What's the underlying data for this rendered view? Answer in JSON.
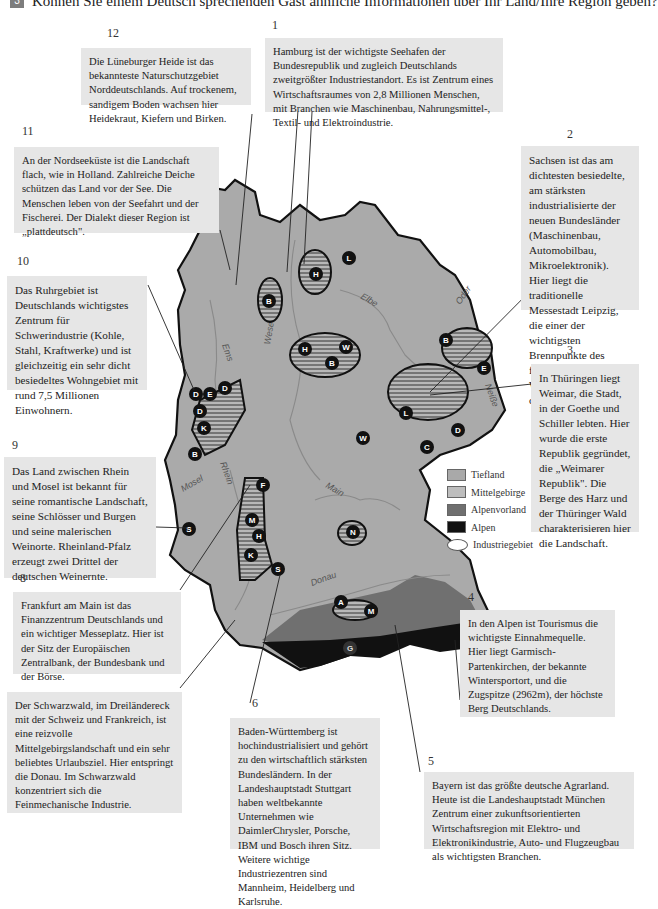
{
  "header": {
    "exercise_number": "3",
    "instruction": "Können Sie einem Deutsch sprechenden Gast ähnliche Informationen über Ihr Land/Ihre Region geben?"
  },
  "boxes": [
    {
      "number": "1",
      "text": "Hamburg ist der wichtigste Seehafen der Bundesrepublik und zugleich Deutschlands zweitgrößter Industriestandort. Es ist Zentrum eines Wirtschaftsraumes von 2,8 Millionen Menschen, mit Branchen wie Maschinenbau, Nahrungsmittel-, Textil- und Elektroindustrie."
    },
    {
      "number": "2",
      "text": "Sachsen ist das am dichtesten besiedelte, am stärksten industrialisierte der neuen Bundesländer (Maschinenbau, Automobilbau, Mikroelektronik). Hier liegt die traditionelle Messestadt Leipzig, die einer der wichtigsten Brennpunkte des friedlichen Widerstandes gegen das DDR-Regime war."
    },
    {
      "number": "3",
      "text": "In Thüringen liegt Weimar, die Stadt, in der Goethe und Schiller lebten. Hier wurde die erste Republik gegründet, die „Weimarer Republik\". Die Berge des Harz und der Thüringer Wald charakterisieren hier die Landschaft."
    },
    {
      "number": "4",
      "text": "In den Alpen ist Tourismus die wichtigste Einnahmequelle. Hier liegt Garmisch-Partenkirchen, der bekannte Wintersportort, und die Zugspitze (2962m), der höchste Berg Deutschlands."
    },
    {
      "number": "5",
      "text": "Bayern ist das größte deutsche Agrarland. Heute ist die Landeshauptstadt München Zentrum einer zukunftsorientierten Wirtschaftsregion mit Elektro- und Elektronikindustrie, Auto- und Flugzeugbau als wichtigsten Branchen."
    },
    {
      "number": "6",
      "text": "Baden-Württemberg ist hochindustrialisiert und gehört zu den wirtschaftlich stärksten Bundesländern. In der Landeshauptstadt Stuttgart haben weltbekannte Unternehmen wie DaimlerChrysler, Porsche, IBM und Bosch ihren Sitz. Weitere wichtige Industriezentren sind Mannheim, Heidelberg und Karlsruhe."
    },
    {
      "number": "7",
      "text": "Der Schwarzwald, im Dreiländereck mit der Schweiz und Frankreich, ist eine reizvolle Mittelgebirgslandschaft und ein sehr beliebtes Urlaubsziel. Hier entspringt die Donau. Im Schwarzwald konzentriert sich die Feinmechanische Industrie."
    },
    {
      "number": "8",
      "text": "Frankfurt am Main ist das Finanzzentrum Deutschlands und ein wichtiger Messeplatz. Hier ist der Sitz der Europäischen Zentralbank, der Bundesbank und der Börse."
    },
    {
      "number": "9",
      "text": "Das Land zwischen Rhein und Mosel ist bekannt für seine romantische Landschaft, seine Schlösser und Burgen und seine malerischen Weinorte. Rheinland-Pfalz erzeugt zwei Drittel der deutschen Weinernte."
    },
    {
      "number": "10",
      "text": "Das Ruhrgebiet ist Deutschlands wichtigstes Zentrum für Schwerindustrie (Kohle, Stahl, Kraftwerke) und ist gleichzeitig ein sehr dicht besiedeltes Wohngebiet mit rund 7,5 Millionen Einwohnern."
    },
    {
      "number": "11",
      "text": "An der Nordseeküste ist die Landschaft flach, wie in Holland. Zahlreiche Deiche schützen das Land vor der See. Die Menschen leben von der Seefahrt und der Fischerei. Der Dialekt dieser Region ist „plattdeutsch\"."
    },
    {
      "number": "12",
      "text": "Die Lüneburger Heide ist das bekannteste Naturschutzgebiet Norddeutschlands. Auf trockenem, sandigem Boden wachsen hier Heidekraut, Kiefern und Birken."
    }
  ],
  "map": {
    "rivers": [
      "Elbe",
      "Oder",
      "Weser",
      "Ems",
      "Neiße",
      "Rhein",
      "Mosel",
      "Main",
      "Donau"
    ],
    "markers": [
      "L",
      "H",
      "B",
      "H",
      "W",
      "B",
      "B",
      "E",
      "D",
      "E",
      "D",
      "D",
      "K",
      "B",
      "L",
      "D",
      "C",
      "W",
      "F",
      "M",
      "H",
      "K",
      "S",
      "S",
      "N",
      "A",
      "M",
      "G"
    ]
  },
  "legend": [
    {
      "label": "Tiefland",
      "color": "#a9a9a9"
    },
    {
      "label": "Mittelgebirge",
      "color": "#bdbdbd"
    },
    {
      "label": "Alpenvorland",
      "color": "#6f6f6f"
    },
    {
      "label": "Alpen",
      "color": "#111111"
    },
    {
      "label": "Industriegebiet",
      "color": "#ffffff"
    }
  ]
}
